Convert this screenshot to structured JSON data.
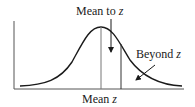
{
  "diagram": {
    "type": "normal-distribution-curve",
    "labels": {
      "top": {
        "text": "Mean to ",
        "var": "z"
      },
      "right": {
        "text": "Beyond ",
        "var": "z"
      },
      "bottom": {
        "text": "Mean ",
        "var": "z"
      }
    },
    "regions": [
      {
        "name": "mean-to-z",
        "description": "Area between mean and z"
      },
      {
        "name": "beyond-z",
        "description": "Area beyond z (tail)"
      }
    ],
    "colors": {
      "stroke": "#1a1a1a",
      "guide": "#555555",
      "background": "#ffffff"
    }
  }
}
